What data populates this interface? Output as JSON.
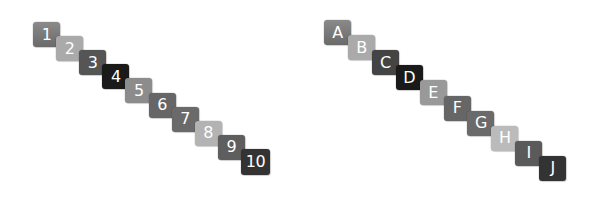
{
  "diagram": {
    "title": "",
    "sequences": [
      {
        "name": "number-sequence",
        "start": {
          "x": 33,
          "y": 22
        },
        "step": {
          "x": 23.1,
          "y": 14.1
        },
        "tiles": [
          {
            "label": "1",
            "color": "#777777",
            "gradient": true
          },
          {
            "label": "2",
            "color": "#aaaaaa",
            "gradient": false
          },
          {
            "label": "3",
            "color": "#555555",
            "gradient": false
          },
          {
            "label": "4",
            "color": "#1a1a1a",
            "gradient": false
          },
          {
            "label": "5",
            "color": "#8c8c8c",
            "gradient": false
          },
          {
            "label": "6",
            "color": "#666666",
            "gradient": false
          },
          {
            "label": "7",
            "color": "#6a6a6a",
            "gradient": false
          },
          {
            "label": "8",
            "color": "#b3b3b3",
            "gradient": false
          },
          {
            "label": "9",
            "color": "#5e5e5e",
            "gradient": false
          },
          {
            "label": "10",
            "color": "#333333",
            "gradient": false
          }
        ]
      },
      {
        "name": "letter-sequence",
        "start": {
          "x": 324,
          "y": 20
        },
        "step": {
          "x": 23.9,
          "y": 15.1
        },
        "tiles": [
          {
            "label": "A",
            "color": "#777777",
            "gradient": true
          },
          {
            "label": "B",
            "color": "#aaaaaa",
            "gradient": false
          },
          {
            "label": "C",
            "color": "#444444",
            "gradient": false
          },
          {
            "label": "D",
            "color": "#1a1a1a",
            "gradient": false
          },
          {
            "label": "E",
            "color": "#999999",
            "gradient": false
          },
          {
            "label": "F",
            "color": "#666666",
            "gradient": false
          },
          {
            "label": "G",
            "color": "#6a6a6a",
            "gradient": false
          },
          {
            "label": "H",
            "color": "#bbbbbb",
            "gradient": false
          },
          {
            "label": "I",
            "color": "#5a5a5a",
            "gradient": false
          },
          {
            "label": "J",
            "color": "#333333",
            "gradient": false
          }
        ]
      }
    ]
  }
}
